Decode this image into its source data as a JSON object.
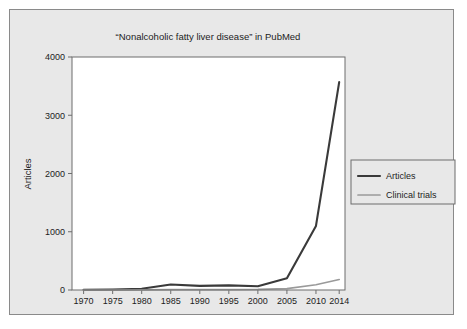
{
  "figure": {
    "panel_bg": "#e8e8e8",
    "panel_border": "#8a8a8a",
    "plot_bg": "#ffffff",
    "frame_color": "#6d6d6d"
  },
  "chart_data": {
    "type": "line",
    "title": "“Nonalcoholic fatty liver disease” in PubMed",
    "xlabel": "",
    "ylabel": "Articles",
    "xlim": [
      1968,
      2015
    ],
    "ylim": [
      0,
      4000
    ],
    "grid": false,
    "legend_position": "right",
    "xticks": [
      1970,
      1975,
      1980,
      1985,
      1990,
      1995,
      2000,
      2005,
      2010,
      2014
    ],
    "xtick_labels": [
      "1970",
      "1975",
      "1980",
      "1985",
      "1990",
      "1995",
      "2000",
      "2005",
      "2010",
      "2014"
    ],
    "yticks": [
      0,
      1000,
      2000,
      3000,
      4000
    ],
    "ytick_labels": [
      "0",
      "1000",
      "2000",
      "3000",
      "4000"
    ],
    "x": [
      1970,
      1975,
      1980,
      1985,
      1990,
      1995,
      2000,
      2005,
      2010,
      2014
    ],
    "series": [
      {
        "name": "Articles",
        "color": "#3a3a3a",
        "width": 2.1,
        "values": [
          5,
          8,
          20,
          95,
          70,
          80,
          65,
          200,
          1100,
          3570
        ]
      },
      {
        "name": "Clinical trials",
        "color": "#9a9a9a",
        "width": 1.7,
        "values": [
          0,
          0,
          2,
          5,
          5,
          8,
          10,
          25,
          90,
          180
        ]
      }
    ]
  }
}
